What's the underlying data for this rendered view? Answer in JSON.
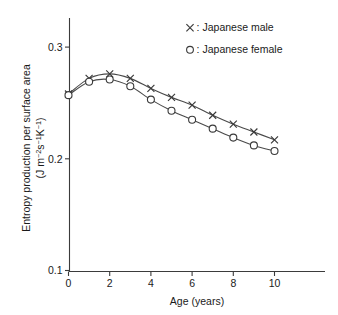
{
  "chart_data": {
    "type": "line",
    "title": "",
    "subtitle": "",
    "xlabel": "Age (years)",
    "ylabel_main": "Entropy production per surface area",
    "ylabel_units": "(J m",
    "ylabel_units_full": "(J m−2s−1K−1)",
    "ylabel_parts": {
      "lead": "(J m",
      "sup1": "−2",
      "mid1": "s",
      "sup2": "−1",
      "mid2": "K",
      "sup3": "−1",
      "tail": ")"
    },
    "x": [
      0,
      1,
      2,
      3,
      4,
      5,
      6,
      7,
      8,
      9,
      10
    ],
    "xlim": [
      -0.35,
      12.5
    ],
    "ylim": [
      0.1,
      0.312
    ],
    "xticks": [
      0,
      2,
      4,
      6,
      8,
      10
    ],
    "xticklabels": [
      "0",
      "2",
      "4",
      "6",
      "8",
      "10"
    ],
    "yticks": [
      0.1,
      0.2,
      0.3
    ],
    "yticklabels": [
      "0.1",
      "0.2",
      "0.3"
    ],
    "grid": false,
    "legend_position": "top-right",
    "series": [
      {
        "name": "Japanese male",
        "marker": "x",
        "values": [
          0.258,
          0.272,
          0.276,
          0.272,
          0.263,
          0.255,
          0.248,
          0.239,
          0.231,
          0.224,
          0.217
        ]
      },
      {
        "name": "Japanese female",
        "marker": "o",
        "values": [
          0.257,
          0.269,
          0.271,
          0.265,
          0.253,
          0.243,
          0.235,
          0.227,
          0.219,
          0.212,
          0.207
        ]
      }
    ],
    "legend": [
      {
        "marker": "×",
        "separator": ":",
        "label": "Japanese male"
      },
      {
        "marker": "○",
        "separator": ":",
        "label": "Japanese female"
      }
    ],
    "colors": {
      "line": "#4a4a4a",
      "marker": "#3a3a3a",
      "axis": "#3b3b3b",
      "text": "#1a1a1a",
      "background": "#ffffff"
    }
  }
}
